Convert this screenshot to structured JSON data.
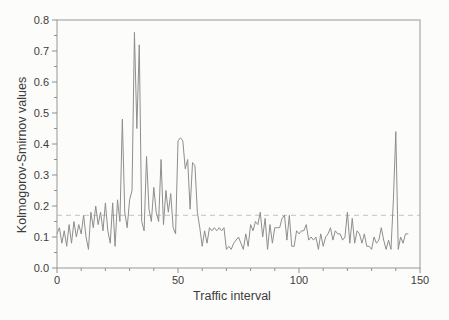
{
  "figure": {
    "background": "#fcfcfb"
  },
  "chart_data": {
    "type": "line",
    "title": "",
    "xlabel": "Traffic interval",
    "ylabel": "Kolmogorov-Smirnov values",
    "xlim": [
      0,
      150
    ],
    "ylim": [
      0,
      0.8
    ],
    "x_ticks": [
      "0",
      "50",
      "100",
      "150"
    ],
    "x_minor_step": 10,
    "y_ticks": [
      "0.0",
      "0.1",
      "0.2",
      "0.3",
      "0.4",
      "0.5",
      "0.6",
      "0.7",
      "0.8"
    ],
    "y_minor_step": 0.05,
    "grid": false,
    "legend": "none",
    "frame": "box",
    "colors": {
      "series_line": "#8e8e8e",
      "threshold_line": "#c4c4c4",
      "frame": "#a9a9a9",
      "tick": "#8f8f8f",
      "text": "#3c3c3c"
    },
    "threshold": {
      "y": 0.17,
      "style": "dashed"
    },
    "series": [
      {
        "x_start": 0,
        "x_step": 1,
        "values": [
          0.11,
          0.13,
          0.08,
          0.12,
          0.07,
          0.14,
          0.08,
          0.15,
          0.1,
          0.14,
          0.11,
          0.17,
          0.1,
          0.06,
          0.18,
          0.13,
          0.2,
          0.14,
          0.18,
          0.12,
          0.21,
          0.12,
          0.08,
          0.21,
          0.07,
          0.22,
          0.15,
          0.48,
          0.18,
          0.13,
          0.22,
          0.25,
          0.76,
          0.45,
          0.72,
          0.15,
          0.12,
          0.36,
          0.19,
          0.15,
          0.26,
          0.18,
          0.15,
          0.35,
          0.14,
          0.25,
          0.18,
          0.24,
          0.13,
          0.11,
          0.41,
          0.42,
          0.41,
          0.32,
          0.35,
          0.19,
          0.34,
          0.33,
          0.18,
          0.13,
          0.07,
          0.12,
          0.08,
          0.13,
          0.12,
          0.13,
          0.12,
          0.13,
          0.12,
          0.13,
          0.06,
          0.07,
          0.06,
          0.08,
          0.09,
          0.1,
          0.08,
          0.06,
          0.11,
          0.07,
          0.14,
          0.12,
          0.15,
          0.14,
          0.18,
          0.1,
          0.16,
          0.06,
          0.14,
          0.08,
          0.13,
          0.13,
          0.13,
          0.16,
          0.17,
          0.09,
          0.17,
          0.07,
          0.07,
          0.12,
          0.11,
          0.12,
          0.12,
          0.14,
          0.09,
          0.1,
          0.09,
          0.1,
          0.06,
          0.11,
          0.07,
          0.1,
          0.11,
          0.13,
          0.09,
          0.12,
          0.11,
          0.11,
          0.09,
          0.1,
          0.18,
          0.08,
          0.16,
          0.08,
          0.12,
          0.11,
          0.08,
          0.11,
          0.07,
          0.07,
          0.06,
          0.1,
          0.08,
          0.09,
          0.13,
          0.09,
          0.06,
          0.09,
          0.06,
          0.22,
          0.44,
          0.06,
          0.1,
          0.08,
          0.11,
          0.11
        ]
      }
    ]
  }
}
